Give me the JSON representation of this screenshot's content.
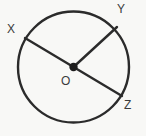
{
  "figure": {
    "kind": "circle-geometry-diagram",
    "background_color": "#f8f8f6",
    "stroke_color": "#2b2b2b",
    "label_color": "#3b3b3b",
    "circle": {
      "center_label": "O",
      "center_x": 73.5,
      "center_y": 67.0,
      "radius": 55.5,
      "stroke_width": 2.4
    },
    "center_point": {
      "name": "O",
      "x": 73.5,
      "y": 67.0,
      "marker_radius": 4.2
    },
    "segments": [
      {
        "name": "diameter-XZ",
        "from_label": "X",
        "to_label": "Z",
        "x1": 25.0,
        "y1": 38.0,
        "x2": 122.0,
        "y2": 96.0,
        "stroke_width": 2.4,
        "type": "diameter"
      },
      {
        "name": "radius-OY",
        "from_label": "O",
        "to_label": "Y",
        "x1": 73.5,
        "y1": 67.0,
        "x2": 117.0,
        "y2": 27.0,
        "stroke_width": 2.4,
        "type": "radius"
      }
    ],
    "labels": [
      {
        "id": "X",
        "text": "X",
        "x": 7,
        "y": 23
      },
      {
        "id": "Y",
        "text": "Y",
        "x": 117,
        "y": 3
      },
      {
        "id": "Z",
        "text": "Z",
        "x": 124,
        "y": 99
      },
      {
        "id": "O",
        "text": "O",
        "x": 61,
        "y": 75
      }
    ]
  }
}
